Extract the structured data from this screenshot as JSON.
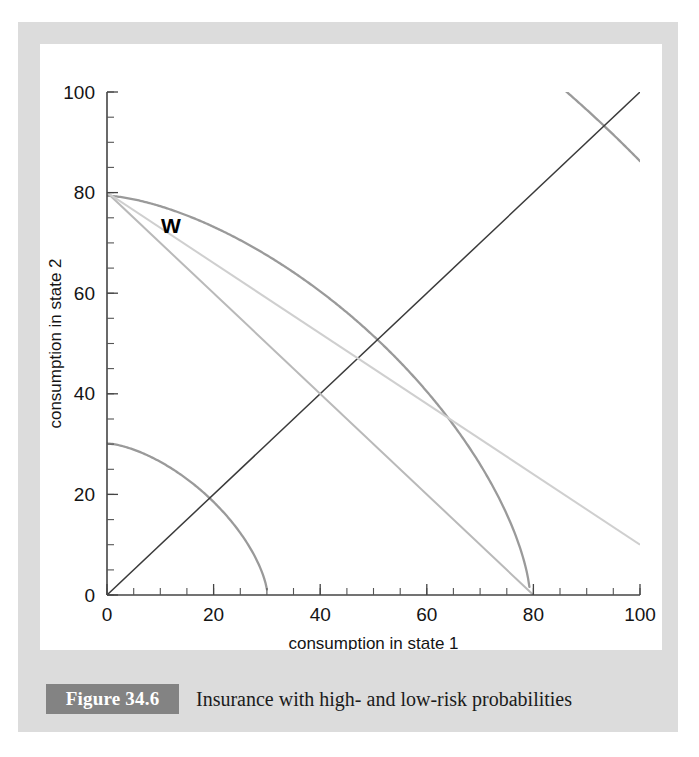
{
  "figure": {
    "badge_label": "Figure 34.6",
    "caption": "Insurance with high- and low-risk probabilities"
  },
  "colors": {
    "panel": "#dcdcdc",
    "plot_background": "#ffffff",
    "badge": "#838383",
    "axis": "#444444",
    "curve_high_risk": "#4a4a4a",
    "curve_low_risk": "#9a9a9a",
    "certainty_line": "#3a3a3a",
    "budget_line": "#c4c4c4"
  },
  "chart_data": {
    "type": "line",
    "title": "",
    "xlabel": "consumption in state 1",
    "ylabel": "consumption in state 2",
    "xlim": [
      0,
      100
    ],
    "ylim": [
      0,
      100
    ],
    "xticks": [
      0,
      20,
      40,
      60,
      80,
      100
    ],
    "yticks": [
      0,
      20,
      40,
      60,
      80,
      100
    ],
    "xtick_labels": [
      "0",
      "20",
      "40",
      "60",
      "80",
      "100"
    ],
    "ytick_labels": [
      "0",
      "20",
      "40",
      "60",
      "80",
      "100"
    ],
    "minor_tick_step": 5,
    "grid": false,
    "legend": "none",
    "annotations": [
      {
        "text": "W",
        "x": 0,
        "y": 80,
        "label_x": 12,
        "label_y": 72
      }
    ],
    "series": [
      {
        "name": "high-risk indifference curve 1",
        "group": "high-risk",
        "color": "#4a4a4a",
        "shape": "hyperbola",
        "exponent": 0.62,
        "constant": 163,
        "x_intercept": 27,
        "y_intercept": 17
      },
      {
        "name": "high-risk indifference curve 2",
        "group": "high-risk",
        "color": "#4a4a4a",
        "shape": "hyperbola",
        "exponent": 0.62,
        "constant": 392,
        "x_intercept": 60,
        "y_intercept": 35
      },
      {
        "name": "high-risk indifference curve 3",
        "group": "high-risk",
        "color": "#4a4a4a",
        "shape": "hyperbola",
        "exponent": 0.62,
        "constant": 745,
        "x_intercept": 100,
        "y_intercept": 56
      },
      {
        "name": "high-risk indifference curve 4",
        "group": "high-risk",
        "color": "#4a4a4a",
        "shape": "hyperbola",
        "exponent": 0.62,
        "constant": 1330,
        "x_intercept": 100,
        "y_intercept": 76
      },
      {
        "name": "high-risk indifference curve 5",
        "group": "high-risk",
        "color": "#4a4a4a",
        "shape": "hyperbola",
        "exponent": 0.62,
        "constant": 2150,
        "x_intercept": 100,
        "y_intercept": 100
      },
      {
        "name": "low-risk indifference curve 1",
        "group": "low-risk",
        "color": "#9a9a9a",
        "shape": "hyperbola",
        "exponent": 1.55,
        "constant": 196,
        "x_intercept": 20,
        "y_intercept": 21
      },
      {
        "name": "low-risk indifference curve 2",
        "group": "low-risk",
        "color": "#9a9a9a",
        "shape": "hyperbola",
        "exponent": 1.55,
        "constant": 880,
        "x_intercept": 45,
        "y_intercept": 44
      },
      {
        "name": "low-risk indifference curve 3",
        "group": "low-risk",
        "color": "#9a9a9a",
        "shape": "hyperbola",
        "exponent": 1.55,
        "constant": 2260,
        "x_intercept": 72,
        "y_intercept": 73
      },
      {
        "name": "low-risk indifference curve 4",
        "group": "low-risk",
        "color": "#9a9a9a",
        "shape": "hyperbola",
        "exponent": 1.55,
        "constant": 4200,
        "x_intercept": 100,
        "y_intercept": 100
      },
      {
        "name": "certainty line (45 degrees)",
        "group": "reference",
        "color": "#3a3a3a",
        "shape": "straight",
        "from": [
          0,
          0
        ],
        "to": [
          100,
          100
        ]
      },
      {
        "name": "budget line high-risk probability",
        "group": "budget",
        "color": "#b9b9b9",
        "shape": "straight",
        "from": [
          0,
          80
        ],
        "to": [
          80,
          0
        ]
      },
      {
        "name": "budget line low-risk probability",
        "group": "budget",
        "color": "#cfcfcf",
        "shape": "straight",
        "from": [
          0,
          80
        ],
        "to": [
          100,
          10
        ]
      }
    ],
    "tangency_points": [
      {
        "x": 30,
        "y": 30
      },
      {
        "x": 50,
        "y": 50
      },
      {
        "x": 70,
        "y": 70
      },
      {
        "x": 90,
        "y": 90
      }
    ]
  }
}
